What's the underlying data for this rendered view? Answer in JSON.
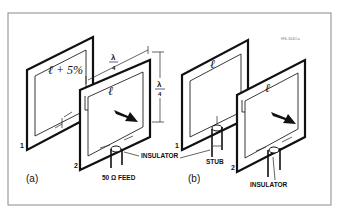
{
  "figure_id": "HS-104Ca",
  "panel_a": {
    "label": "(a)",
    "loop1": {
      "number": "1",
      "length_label": "ℓ + 5%"
    },
    "loop2": {
      "number": "2",
      "length_label": "ℓ"
    },
    "spacing_label": {
      "num": "λ",
      "den": "4"
    },
    "side_label": {
      "num": "λ",
      "den": "4"
    },
    "insulator_label": "INSULATOR",
    "feed_label": "50 Ω  FEED"
  },
  "panel_b": {
    "label": "(b)",
    "loop1": {
      "number": "1",
      "length_label": "ℓ"
    },
    "loop2": {
      "number": "2",
      "length_label": "ℓ"
    },
    "stub_label": "STUB",
    "insulator_label": "INSULATOR"
  }
}
